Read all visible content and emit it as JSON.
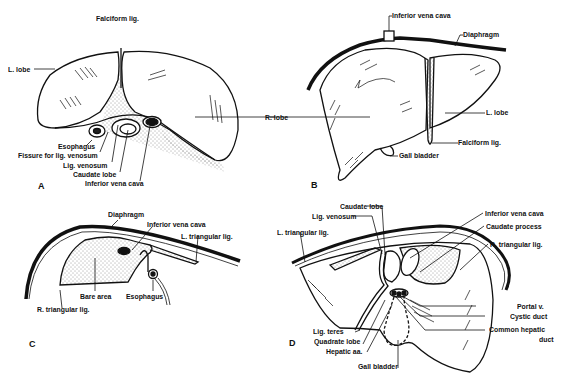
{
  "figure": {
    "panels": [
      {
        "id": "A",
        "letter": "A",
        "labels": {
          "falciform": "Falciform lig.",
          "l_lobe": "L. lobe",
          "r_lobe": "R. lobe",
          "esophagus": "Esophagus",
          "fissure": "Fissure for lig. venosum",
          "lig_venosum": "Lig. venosum",
          "caudate": "Caudate lobe",
          "ivc": "Inferior vena cava"
        }
      },
      {
        "id": "B",
        "letter": "B",
        "labels": {
          "ivc": "Inferior vena cava",
          "diaphragm": "Diaphragm",
          "l_lobe": "L. lobe",
          "falciform": "Falciform lig.",
          "gall_bladder": "Gall bladder"
        }
      },
      {
        "id": "C",
        "letter": "C",
        "labels": {
          "diaphragm": "Diaphragm",
          "ivc": "Inferior vena cava",
          "l_triangular": "L. triangular lig.",
          "bare_area": "Bare area",
          "esophagus": "Esophagus",
          "r_triangular": "R. triangular lig."
        }
      },
      {
        "id": "D",
        "letter": "D",
        "labels": {
          "caudate": "Caudate lobe",
          "lig_venosum": "Lig. venosum",
          "l_triangular": "L. triangular lig.",
          "ivc": "Inferior vena cava",
          "caudate_process": "Caudate process",
          "r_triangular": "R. triangular lig.",
          "portal": "Portal v.",
          "cystic": "Cystic duct",
          "common_hepatic_1": "Common hepatic",
          "common_hepatic_2": "duct",
          "lig_teres": "Lig. teres",
          "quadrate": "Quadrate lobe",
          "hepatic_aa": "Hepatic aa.",
          "gall_bladder": "Gall bladder"
        }
      }
    ]
  }
}
